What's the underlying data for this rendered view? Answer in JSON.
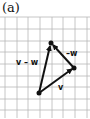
{
  "panel_label": "(a)",
  "grid": {
    "x_lines": [
      5,
      17,
      28,
      40,
      52,
      63,
      75,
      87
    ],
    "y_lines": [
      17,
      29,
      41,
      52,
      64,
      76,
      87,
      99,
      110
    ],
    "color": "#b8b8b8"
  },
  "points": {
    "top": [
      51,
      43
    ],
    "right": [
      74,
      68
    ],
    "bottom": [
      39,
      93
    ]
  },
  "vectors": [
    {
      "name": "v",
      "label": "v",
      "from": "bottom",
      "to": "right"
    },
    {
      "name": "-w",
      "label": "–w",
      "from": "right",
      "to": "top"
    },
    {
      "name": "v-w",
      "label": "v – w",
      "from": "bottom",
      "to": "top"
    }
  ],
  "labels": {
    "v": "v",
    "neg_w": "–w",
    "v_minus_w": "v – w"
  },
  "colors": {
    "ink": "#111111",
    "grid": "#b8b8b8",
    "background": "#ffffff"
  }
}
